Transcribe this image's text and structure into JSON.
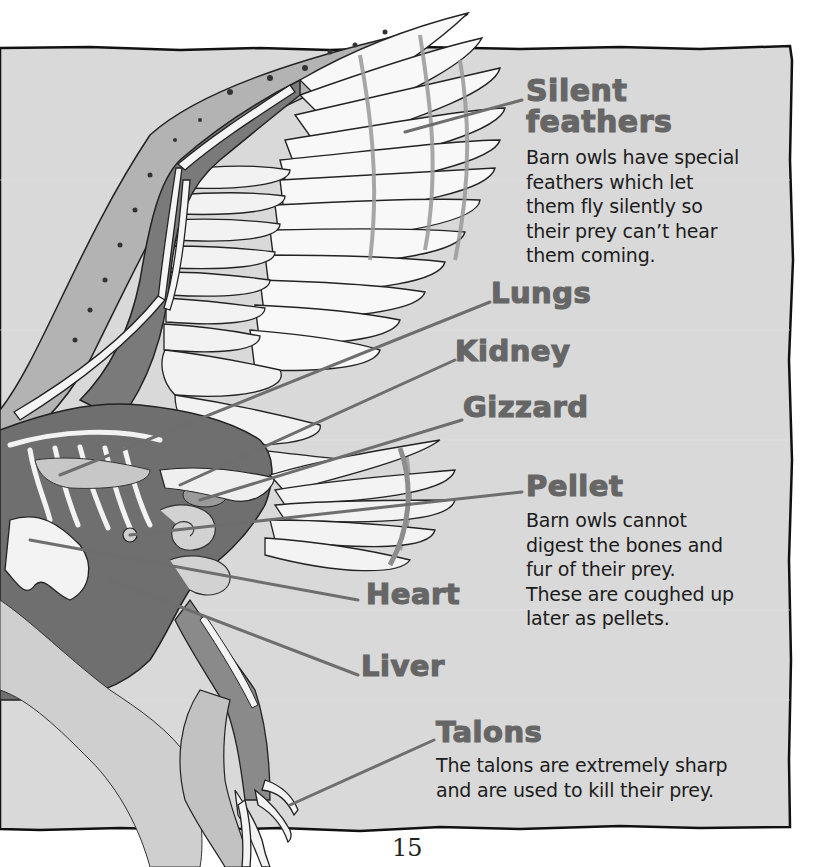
{
  "page": {
    "background_color": "#d9d9d9",
    "panel_border_color": "#111111",
    "label_color": "#666666",
    "text_color": "#1c1c1c",
    "page_number": "15"
  },
  "labels": {
    "silent_feathers": {
      "title_line1": "Silent",
      "title_line2": "feathers",
      "description": [
        "Barn owls have special",
        "feathers which let",
        "them fly silently so",
        "their prey can’t hear",
        "them coming."
      ]
    },
    "lungs": {
      "title": "Lungs"
    },
    "kidney": {
      "title": "Kidney"
    },
    "gizzard": {
      "title": "Gizzard"
    },
    "pellet": {
      "title": "Pellet",
      "description": [
        "Barn owls cannot",
        "digest the bones and",
        "fur of their prey.",
        "These are coughed up",
        "later as pellets."
      ]
    },
    "heart": {
      "title": "Heart"
    },
    "liver": {
      "title": "Liver"
    },
    "talons": {
      "title": "Talons",
      "description": [
        "The talons are extremely sharp",
        "and are used to kill their prey."
      ]
    }
  },
  "illustration": {
    "subject": "barn-owl-anatomy-cutaway",
    "parts": [
      "wing",
      "feathers",
      "skeleton",
      "lungs",
      "kidney",
      "gizzard",
      "pellet",
      "heart",
      "liver",
      "leg",
      "talons"
    ]
  }
}
